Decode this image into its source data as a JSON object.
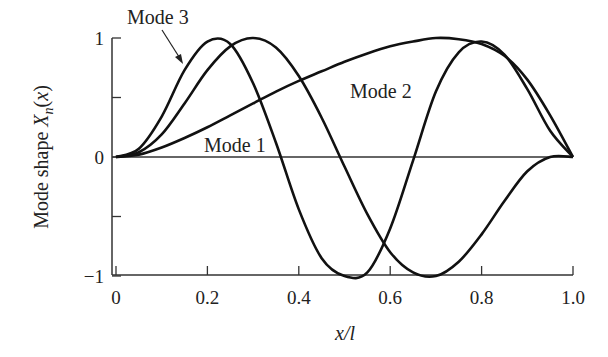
{
  "chart_data": {
    "type": "line",
    "title": "",
    "xlabel": "x/l",
    "ylabel": "Mode shape X_n(x)",
    "xlim": [
      0,
      1.0
    ],
    "ylim": [
      -1,
      1
    ],
    "xticks": [
      "0",
      "0.2",
      "0.4",
      "0.6",
      "0.8",
      "1.0"
    ],
    "yticks": [
      "−1",
      "0",
      "1"
    ],
    "grid": false,
    "legend": "inline annotations",
    "annotations": [
      {
        "text": "Mode 3",
        "x": 0.08,
        "y": 1.2,
        "arrow_to": [
          0.2,
          0.85
        ]
      },
      {
        "text": "Mode 2",
        "x": 0.52,
        "y": 0.6
      },
      {
        "text": "Mode 1",
        "x": 0.2,
        "y": 0.1
      }
    ],
    "series": [
      {
        "name": "Mode 1",
        "x": [
          0,
          0.05,
          0.1,
          0.15,
          0.2,
          0.25,
          0.3,
          0.35,
          0.4,
          0.45,
          0.5,
          0.55,
          0.6,
          0.65,
          0.7,
          0.75,
          0.8,
          0.85,
          0.9,
          0.95,
          1.0
        ],
        "values": [
          0,
          0.02,
          0.08,
          0.16,
          0.25,
          0.35,
          0.45,
          0.55,
          0.64,
          0.72,
          0.8,
          0.87,
          0.93,
          0.97,
          1.0,
          0.99,
          0.95,
          0.85,
          0.65,
          0.35,
          0
        ]
      },
      {
        "name": "Mode 2",
        "x": [
          0,
          0.05,
          0.1,
          0.15,
          0.2,
          0.25,
          0.3,
          0.35,
          0.4,
          0.45,
          0.5,
          0.55,
          0.6,
          0.65,
          0.7,
          0.75,
          0.8,
          0.85,
          0.9,
          0.95,
          1.0
        ],
        "values": [
          0,
          0.04,
          0.19,
          0.45,
          0.73,
          0.93,
          1.0,
          0.92,
          0.68,
          0.33,
          -0.08,
          -0.48,
          -0.8,
          -0.97,
          -1.0,
          -0.88,
          -0.65,
          -0.37,
          -0.12,
          0.0,
          0
        ]
      },
      {
        "name": "Mode 3",
        "x": [
          0,
          0.05,
          0.1,
          0.15,
          0.2,
          0.25,
          0.3,
          0.35,
          0.4,
          0.45,
          0.5,
          0.55,
          0.6,
          0.65,
          0.7,
          0.75,
          0.8,
          0.85,
          0.9,
          0.95,
          1.0
        ],
        "values": [
          0,
          0.07,
          0.34,
          0.73,
          0.97,
          0.95,
          0.62,
          0.12,
          -0.44,
          -0.85,
          -1.0,
          -0.97,
          -0.6,
          -0.03,
          0.55,
          0.88,
          0.97,
          0.86,
          0.57,
          0.22,
          0
        ]
      }
    ]
  }
}
